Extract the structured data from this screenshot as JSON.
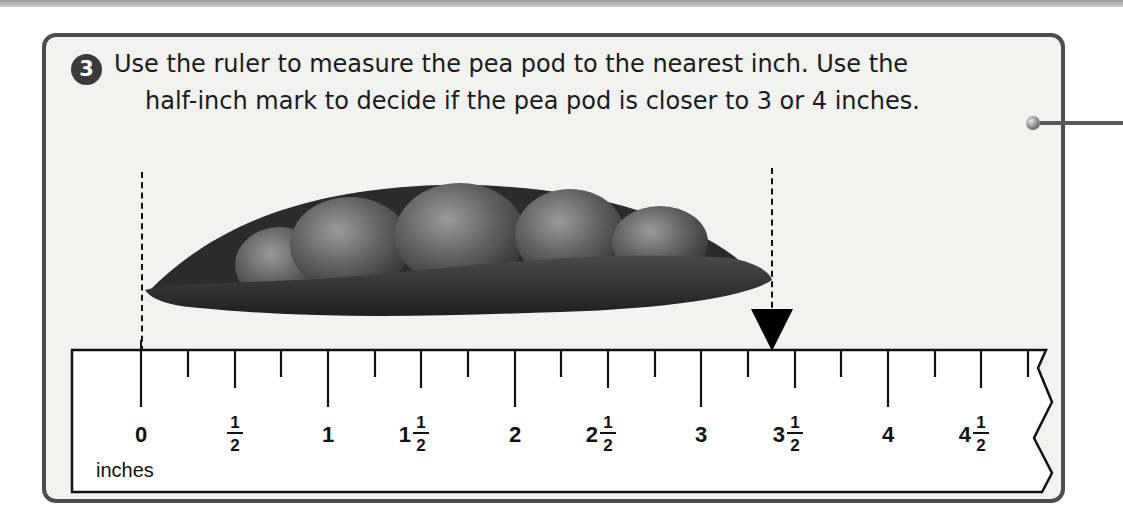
{
  "problem": {
    "number": "3",
    "instruction_line1": "Use the ruler to measure the pea pod to the nearest inch. Use the",
    "instruction_line2": "half-inch mark to decide if the pea pod is closer to 3 or 4 inches."
  },
  "ruler": {
    "unit_label": "inches",
    "marks": [
      {
        "whole": "0",
        "frac_num": "",
        "frac_den": ""
      },
      {
        "whole": "",
        "frac_num": "1",
        "frac_den": "2"
      },
      {
        "whole": "1",
        "frac_num": "",
        "frac_den": ""
      },
      {
        "whole": "1",
        "frac_num": "1",
        "frac_den": "2"
      },
      {
        "whole": "2",
        "frac_num": "",
        "frac_den": ""
      },
      {
        "whole": "2",
        "frac_num": "1",
        "frac_den": "2"
      },
      {
        "whole": "3",
        "frac_num": "",
        "frac_den": ""
      },
      {
        "whole": "3",
        "frac_num": "1",
        "frac_den": "2"
      },
      {
        "whole": "4",
        "frac_num": "",
        "frac_den": ""
      },
      {
        "whole": "4",
        "frac_num": "1",
        "frac_den": "2"
      }
    ],
    "tick_interval_inches": 0.25
  },
  "illustration": {
    "object": "pea pod",
    "pod_start_on_ruler": 0,
    "pointer_position_on_ruler": 3.75
  },
  "colors": {
    "card_border": "#4d4d4d",
    "card_background": "#f2f2f1",
    "badge": "#3a3a3a",
    "pod": "#2f2f2f",
    "ink": "#111111"
  }
}
